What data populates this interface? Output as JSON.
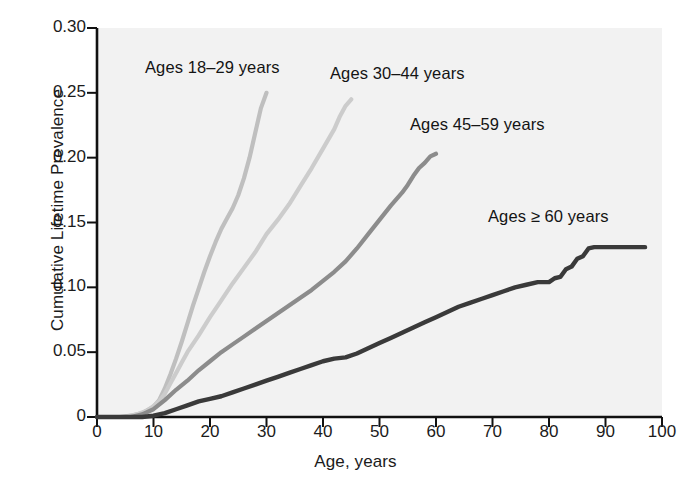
{
  "figure": {
    "background": "#ffffff",
    "plot_background": "#f2f2f2"
  },
  "axes": {
    "x": {
      "label": "Age, years",
      "ticks": [
        "0",
        "10",
        "20",
        "30",
        "40",
        "50",
        "60",
        "70",
        "80",
        "90",
        "100"
      ],
      "min": 0,
      "max": 100
    },
    "y": {
      "label": "Cumulative Lifetime Prevalence",
      "ticks": [
        "0",
        "0.05",
        "0.10",
        "0.15",
        "0.20",
        "0.25",
        "0.30"
      ],
      "min": 0,
      "max": 0.3
    }
  },
  "annotations": [
    {
      "name": "label-ages-18-29",
      "text": "Ages 18–29 years",
      "x": 145,
      "y": 58
    },
    {
      "name": "label-ages-30-44",
      "text": "Ages 30–44 years",
      "x": 330,
      "y": 64
    },
    {
      "name": "label-ages-45-59",
      "text": "Ages 45–59 years",
      "x": 410,
      "y": 115
    },
    {
      "name": "label-ages-60plus",
      "text": "Ages ≥ 60 years",
      "x": 488,
      "y": 207
    }
  ],
  "chart_data": {
    "type": "line",
    "title": "",
    "xlabel": "Age, years",
    "ylabel": "Cumulative Lifetime Prevalence",
    "xlim": [
      0,
      100
    ],
    "ylim": [
      0,
      0.3
    ],
    "grid": false,
    "legend_position": "inline-annotations",
    "series": [
      {
        "name": "Ages 18–29 years",
        "color": "#bfbfbf",
        "points": [
          [
            0,
            0.0
          ],
          [
            4,
            0.0
          ],
          [
            6,
            0.001
          ],
          [
            8,
            0.003
          ],
          [
            10,
            0.008
          ],
          [
            11,
            0.013
          ],
          [
            12,
            0.022
          ],
          [
            13,
            0.033
          ],
          [
            14,
            0.045
          ],
          [
            15,
            0.058
          ],
          [
            16,
            0.072
          ],
          [
            17,
            0.086
          ],
          [
            18,
            0.099
          ],
          [
            19,
            0.112
          ],
          [
            20,
            0.124
          ],
          [
            21,
            0.135
          ],
          [
            22,
            0.145
          ],
          [
            23,
            0.153
          ],
          [
            24,
            0.161
          ],
          [
            25,
            0.171
          ],
          [
            26,
            0.184
          ],
          [
            27,
            0.2
          ],
          [
            28,
            0.219
          ],
          [
            29,
            0.238
          ],
          [
            30,
            0.25
          ]
        ]
      },
      {
        "name": "Ages 30–44 years",
        "color": "#cccccc",
        "points": [
          [
            0,
            0.0
          ],
          [
            5,
            0.0
          ],
          [
            7,
            0.002
          ],
          [
            9,
            0.005
          ],
          [
            11,
            0.012
          ],
          [
            12,
            0.018
          ],
          [
            13,
            0.026
          ],
          [
            14,
            0.034
          ],
          [
            15,
            0.042
          ],
          [
            16,
            0.05
          ],
          [
            18,
            0.063
          ],
          [
            20,
            0.077
          ],
          [
            22,
            0.09
          ],
          [
            24,
            0.103
          ],
          [
            26,
            0.115
          ],
          [
            28,
            0.127
          ],
          [
            30,
            0.141
          ],
          [
            32,
            0.152
          ],
          [
            34,
            0.164
          ],
          [
            36,
            0.178
          ],
          [
            38,
            0.192
          ],
          [
            40,
            0.207
          ],
          [
            42,
            0.222
          ],
          [
            43,
            0.232
          ],
          [
            44,
            0.24
          ],
          [
            45,
            0.245
          ]
        ]
      },
      {
        "name": "Ages 45–59 years",
        "color": "#8c8c8c",
        "points": [
          [
            0,
            0.0
          ],
          [
            6,
            0.0
          ],
          [
            8,
            0.002
          ],
          [
            10,
            0.006
          ],
          [
            12,
            0.013
          ],
          [
            14,
            0.021
          ],
          [
            16,
            0.028
          ],
          [
            18,
            0.036
          ],
          [
            20,
            0.043
          ],
          [
            22,
            0.05
          ],
          [
            24,
            0.056
          ],
          [
            26,
            0.062
          ],
          [
            28,
            0.068
          ],
          [
            30,
            0.074
          ],
          [
            32,
            0.08
          ],
          [
            34,
            0.086
          ],
          [
            36,
            0.092
          ],
          [
            38,
            0.098
          ],
          [
            40,
            0.105
          ],
          [
            42,
            0.112
          ],
          [
            44,
            0.12
          ],
          [
            46,
            0.13
          ],
          [
            48,
            0.141
          ],
          [
            50,
            0.152
          ],
          [
            52,
            0.163
          ],
          [
            54,
            0.173
          ],
          [
            55,
            0.179
          ],
          [
            56,
            0.186
          ],
          [
            57,
            0.192
          ],
          [
            58,
            0.196
          ],
          [
            59,
            0.201
          ],
          [
            60,
            0.203
          ]
        ]
      },
      {
        "name": "Ages ≥ 60 years",
        "color": "#3a3a3a",
        "points": [
          [
            0,
            0.0
          ],
          [
            8,
            0.0
          ],
          [
            10,
            0.001
          ],
          [
            12,
            0.003
          ],
          [
            14,
            0.006
          ],
          [
            16,
            0.009
          ],
          [
            18,
            0.012
          ],
          [
            20,
            0.014
          ],
          [
            22,
            0.016
          ],
          [
            24,
            0.019
          ],
          [
            26,
            0.022
          ],
          [
            28,
            0.025
          ],
          [
            30,
            0.028
          ],
          [
            32,
            0.031
          ],
          [
            34,
            0.034
          ],
          [
            36,
            0.037
          ],
          [
            38,
            0.04
          ],
          [
            40,
            0.043
          ],
          [
            42,
            0.045
          ],
          [
            44,
            0.046
          ],
          [
            46,
            0.049
          ],
          [
            48,
            0.053
          ],
          [
            50,
            0.057
          ],
          [
            52,
            0.061
          ],
          [
            54,
            0.065
          ],
          [
            56,
            0.069
          ],
          [
            58,
            0.073
          ],
          [
            60,
            0.077
          ],
          [
            62,
            0.081
          ],
          [
            64,
            0.085
          ],
          [
            66,
            0.088
          ],
          [
            68,
            0.091
          ],
          [
            70,
            0.094
          ],
          [
            72,
            0.097
          ],
          [
            74,
            0.1
          ],
          [
            76,
            0.102
          ],
          [
            78,
            0.104
          ],
          [
            80,
            0.104
          ],
          [
            81,
            0.107
          ],
          [
            82,
            0.108
          ],
          [
            83,
            0.114
          ],
          [
            84,
            0.116
          ],
          [
            85,
            0.122
          ],
          [
            86,
            0.124
          ],
          [
            87,
            0.13
          ],
          [
            88,
            0.131
          ],
          [
            97,
            0.131
          ]
        ]
      }
    ]
  }
}
